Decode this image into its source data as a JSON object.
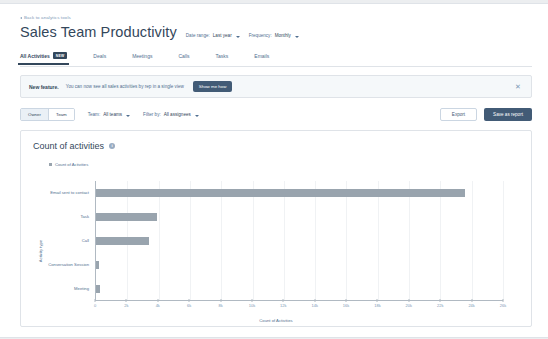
{
  "header": {
    "back_link": "Back to analytics tools",
    "back_icon": "chevron-left-icon",
    "title": "Sales Team Productivity",
    "date_range_label": "Date range:",
    "date_range_value": "Last year",
    "frequency_label": "Frequency:",
    "frequency_value": "Monthly"
  },
  "tabs": [
    {
      "label": "All Activities",
      "badge": "New",
      "active": true
    },
    {
      "label": "Deals",
      "badge": "",
      "active": false
    },
    {
      "label": "Meetings",
      "badge": "",
      "active": false
    },
    {
      "label": "Calls",
      "badge": "",
      "active": false
    },
    {
      "label": "Tasks",
      "badge": "",
      "active": false
    },
    {
      "label": "Emails",
      "badge": "",
      "active": false
    }
  ],
  "banner": {
    "strong": "New feature.",
    "text": "You can now see all sales activities by rep in a single view",
    "button": "Show me how",
    "close_icon": "close-icon"
  },
  "filters": {
    "segment": [
      {
        "label": "Owner",
        "selected": true
      },
      {
        "label": "Team",
        "selected": false
      }
    ],
    "team_label": "Team:",
    "team_value": "All teams",
    "filterby_label": "Filter by:",
    "filterby_value": "All assignees",
    "export_button": "Export",
    "save_button": "Save as report"
  },
  "chart_card": {
    "title": "Count of activities",
    "info_icon": "info-icon"
  },
  "chart_data": {
    "type": "bar",
    "orientation": "horizontal",
    "title": "Count of activities",
    "legend": [
      "Count of Activities"
    ],
    "legend_position": "top-left",
    "categories": [
      "Email sent to contact",
      "Task",
      "Call",
      "Conversation Session",
      "Meeting"
    ],
    "values": [
      23600,
      3900,
      3400,
      200,
      250
    ],
    "xlabel": "Count of Activities",
    "ylabel": "Activity type",
    "xlim": [
      0,
      26000
    ],
    "xticks": [
      0,
      2000,
      4000,
      6000,
      8000,
      10000,
      12000,
      14000,
      16000,
      18000,
      20000,
      22000,
      24000,
      26000
    ],
    "xticklabels": [
      "0",
      "2k",
      "4k",
      "6k",
      "8k",
      "10k",
      "12k",
      "14k",
      "16k",
      "18k",
      "20k",
      "22k",
      "24k",
      "26k"
    ],
    "grid": true,
    "bar_color": "#99a4ae"
  }
}
